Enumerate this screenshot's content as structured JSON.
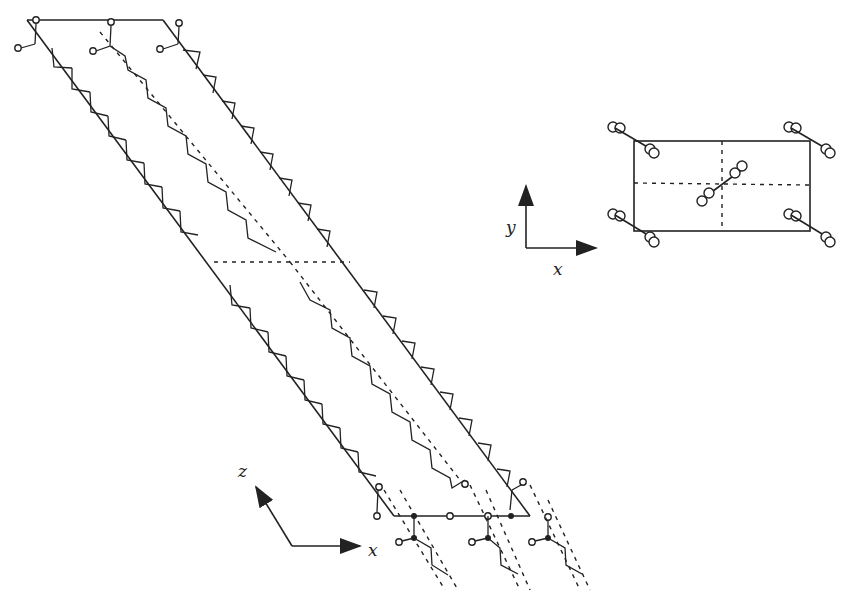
{
  "figure": {
    "colors": {
      "ink": "#222222",
      "background": "#ffffff"
    }
  },
  "main_projection": {
    "view": "x-z",
    "axes": {
      "horizontal": "x",
      "vertical": "z"
    },
    "unit_cell": "oblique parallelogram",
    "chains": 3
  },
  "inset_projection": {
    "view": "x-y",
    "axes": {
      "horizontal": "x",
      "vertical": "y"
    },
    "unit_cell": "rectangular",
    "chains": 5
  },
  "labels": {
    "xz_x": "x",
    "xz_z": "z",
    "xy_x": "x",
    "xy_y": "y"
  }
}
